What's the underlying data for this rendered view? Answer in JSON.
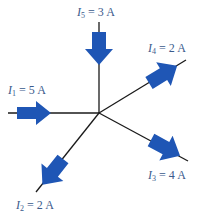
{
  "diagram": {
    "type": "kirchhoff-current-node",
    "colors": {
      "arrow": "#1f56b5",
      "wire": "#1a1a1a",
      "label": "#3a5a8c",
      "background": "#ffffff"
    },
    "node": {
      "x": 99,
      "y": 113
    },
    "branches": [
      {
        "id": "I1",
        "symbol": "I",
        "subscript": "1",
        "equals": "=",
        "value": "5",
        "unit": "A",
        "direction": "into-node",
        "wire_end": {
          "x": 8,
          "y": 113
        }
      },
      {
        "id": "I2",
        "symbol": "I",
        "subscript": "2",
        "equals": "=",
        "value": "2",
        "unit": "A",
        "direction": "out-of-node",
        "wire_end": {
          "x": 36,
          "y": 192
        }
      },
      {
        "id": "I3",
        "symbol": "I",
        "subscript": "3",
        "equals": "=",
        "value": "4",
        "unit": "A",
        "direction": "out-of-node",
        "wire_end": {
          "x": 188,
          "y": 161
        }
      },
      {
        "id": "I4",
        "symbol": "I",
        "subscript": "4",
        "equals": "=",
        "value": "2",
        "unit": "A",
        "direction": "out-of-node",
        "wire_end": {
          "x": 186,
          "y": 60
        }
      },
      {
        "id": "I5",
        "symbol": "I",
        "subscript": "5",
        "equals": "=",
        "value": "3",
        "unit": "A",
        "direction": "into-node",
        "wire_end": {
          "x": 99,
          "y": 22
        }
      }
    ]
  }
}
